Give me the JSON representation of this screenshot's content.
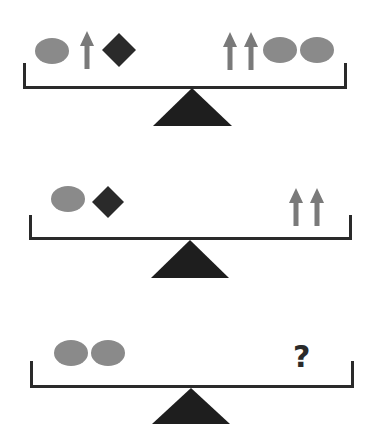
{
  "puzzle": {
    "type": "balance-scale puzzle",
    "colors": {
      "oval": "#8a8a8a",
      "arrow": "#7a7a7a",
      "diamond": "#2a2a2a",
      "beam": "#2a2a2a",
      "fulcrum": "#1e1e1e",
      "question_mark": "#2a2a2a"
    },
    "scales": [
      {
        "id": 1,
        "left": [
          "oval",
          "arrow",
          "diamond"
        ],
        "right": [
          "arrow",
          "arrow",
          "oval",
          "oval"
        ]
      },
      {
        "id": 2,
        "left": [
          "oval",
          "diamond"
        ],
        "right": [
          "arrow",
          "arrow"
        ]
      },
      {
        "id": 3,
        "left": [
          "oval",
          "oval"
        ],
        "right": [
          "unknown"
        ],
        "unknown_label": "?"
      }
    ]
  }
}
